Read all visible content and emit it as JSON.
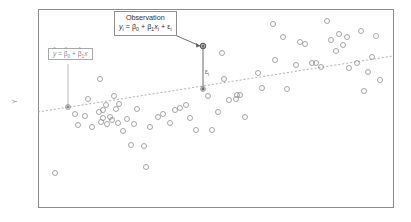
{
  "figure": {
    "type": "scatter-with-regression",
    "background_color": "#ffffff",
    "frame_color": "#8c8c8c"
  },
  "axes": {
    "y_label": "Y",
    "x_label": "",
    "frame": {
      "left": 38,
      "top": 9,
      "right": 393,
      "bottom": 207
    },
    "ticks_visible": false,
    "grid": false
  },
  "annotations": {
    "observation_box": {
      "title": "Observation",
      "equation_plain": "y_i = β_0 + β_1 x_i + ε_i",
      "eq_y": "y",
      "eq_y_sub": "i",
      "eq_eq": " = ",
      "eq_b0": "β",
      "eq_b0_sub": "0",
      "eq_plus1": " + ",
      "eq_b1": "β",
      "eq_b1_sub": "1",
      "eq_x": "x",
      "eq_x_sub": "i",
      "eq_plus2": " + ",
      "eq_eps": "ε",
      "eq_eps_sub": "i",
      "border_color": "#8f8f8f",
      "text_color": "#2e2e2e"
    },
    "fitline_box": {
      "equation_plain": "ŷ = β̅0 + β̅1 x",
      "eq_yhat": "y",
      "eq_hat": "^",
      "eq_eq": " = ",
      "eq_b0": "β",
      "eq_b0_sub": "0",
      "eq_plus": " + ",
      "eq_b1": "β",
      "eq_b1_sub": "1",
      "eq_x": "x",
      "border_color": "#a9a9a9",
      "text_color": "#8b8b8b"
    },
    "residual_label": {
      "symbol": "ε",
      "subscript": "i",
      "color": "#5a5a5a"
    }
  },
  "chart_data": {
    "type": "scatter",
    "title": "",
    "xlabel": "",
    "ylabel": "Y",
    "grid": false,
    "legend": "none",
    "xlim": [
      38,
      393
    ],
    "ylim": [
      207,
      9
    ],
    "marker": {
      "shape": "open-circle",
      "radius": 2.5,
      "stroke": "#8e8e8e",
      "stroke_width": 0.8,
      "fill": "none"
    },
    "regression_line": {
      "style": "dashed",
      "color": "#b2b2b2",
      "width": 1,
      "dash": "2,2",
      "x1": 38,
      "y1": 112,
      "x2": 393,
      "y2": 56
    },
    "highlighted_point": {
      "x": 203,
      "y": 46
    },
    "residual_segment": {
      "x": 203,
      "y_top": 46,
      "y_bottom": 89
    },
    "leader_observation": {
      "x1": 175,
      "y1": 35,
      "x2": 200,
      "y2": 46
    },
    "leader_fitline": {
      "x1": 68,
      "y1": 64,
      "x2": 68,
      "y2": 107
    },
    "points": [
      [
        68,
        107
      ],
      [
        75,
        114
      ],
      [
        78,
        125
      ],
      [
        85,
        116
      ],
      [
        88,
        99
      ],
      [
        92,
        127
      ],
      [
        99,
        112
      ],
      [
        101,
        122
      ],
      [
        103,
        110
      ],
      [
        103,
        118
      ],
      [
        106,
        105
      ],
      [
        107,
        124
      ],
      [
        110,
        117
      ],
      [
        112,
        120
      ],
      [
        114,
        96
      ],
      [
        116,
        109
      ],
      [
        118,
        123
      ],
      [
        119,
        104
      ],
      [
        123,
        131
      ],
      [
        127,
        119
      ],
      [
        131,
        145
      ],
      [
        134,
        124
      ],
      [
        137,
        109
      ],
      [
        144,
        146
      ],
      [
        146,
        167
      ],
      [
        100,
        79
      ],
      [
        55,
        173
      ],
      [
        150,
        127
      ],
      [
        158,
        117
      ],
      [
        163,
        114
      ],
      [
        170,
        123
      ],
      [
        175,
        110
      ],
      [
        180,
        108
      ],
      [
        186,
        105
      ],
      [
        190,
        118
      ],
      [
        196,
        130
      ],
      [
        203,
        46
      ],
      [
        203,
        89
      ],
      [
        208,
        96
      ],
      [
        212,
        130
      ],
      [
        218,
        112
      ],
      [
        222,
        53
      ],
      [
        224,
        79
      ],
      [
        229,
        100
      ],
      [
        236,
        99
      ],
      [
        237,
        95
      ],
      [
        240,
        95
      ],
      [
        245,
        117
      ],
      [
        258,
        73
      ],
      [
        262,
        88
      ],
      [
        273,
        24
      ],
      [
        275,
        60
      ],
      [
        283,
        37
      ],
      [
        287,
        89
      ],
      [
        296,
        65
      ],
      [
        300,
        42
      ],
      [
        305,
        44
      ],
      [
        312,
        63
      ],
      [
        316,
        63
      ],
      [
        321,
        67
      ],
      [
        327,
        21
      ],
      [
        331,
        40
      ],
      [
        336,
        51
      ],
      [
        339,
        34
      ],
      [
        343,
        45
      ],
      [
        347,
        37
      ],
      [
        349,
        68
      ],
      [
        357,
        63
      ],
      [
        361,
        31
      ],
      [
        364,
        91
      ],
      [
        368,
        72
      ],
      [
        372,
        57
      ],
      [
        376,
        36
      ],
      [
        380,
        80
      ]
    ],
    "n_points": 74
  }
}
